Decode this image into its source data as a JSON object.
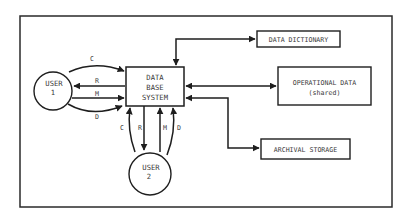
{
  "diagram": {
    "type": "data flow diagram",
    "nodes": {
      "dbms": {
        "lines": [
          "DATA",
          "BASE",
          "SYSTEM"
        ]
      },
      "user1": {
        "lines": [
          "USER",
          "1"
        ]
      },
      "user2": {
        "lines": [
          "USER",
          "2"
        ]
      },
      "data_dictionary": {
        "label": "DATA DICTIONARY"
      },
      "operational_data": {
        "lines": [
          "OPERATIONAL DATA",
          "(shared)"
        ]
      },
      "archival_storage": {
        "label": "ARCHIVAL STORAGE"
      }
    },
    "user1_flows": {
      "c": "C",
      "r": "R",
      "m": "M",
      "d": "D"
    },
    "user2_flows": {
      "c": "C",
      "r": "R",
      "m": "M",
      "d": "D"
    },
    "edges": [
      {
        "from": "user1",
        "to": "dbms",
        "label": "C"
      },
      {
        "from": "dbms",
        "to": "user1",
        "label": "R"
      },
      {
        "from": "user1",
        "to": "dbms",
        "label": "M"
      },
      {
        "from": "user1",
        "to": "dbms",
        "label": "D"
      },
      {
        "from": "user2",
        "to": "dbms",
        "label": "C"
      },
      {
        "from": "dbms",
        "to": "user2",
        "label": "R"
      },
      {
        "from": "user2",
        "to": "dbms",
        "label": "M"
      },
      {
        "from": "user2",
        "to": "dbms",
        "label": "D"
      },
      {
        "from": "dbms",
        "to": "data_dictionary",
        "direction": "bidirectional"
      },
      {
        "from": "dbms",
        "to": "operational_data",
        "direction": "bidirectional"
      },
      {
        "from": "dbms",
        "to": "archival_storage",
        "direction": "bidirectional"
      }
    ]
  }
}
